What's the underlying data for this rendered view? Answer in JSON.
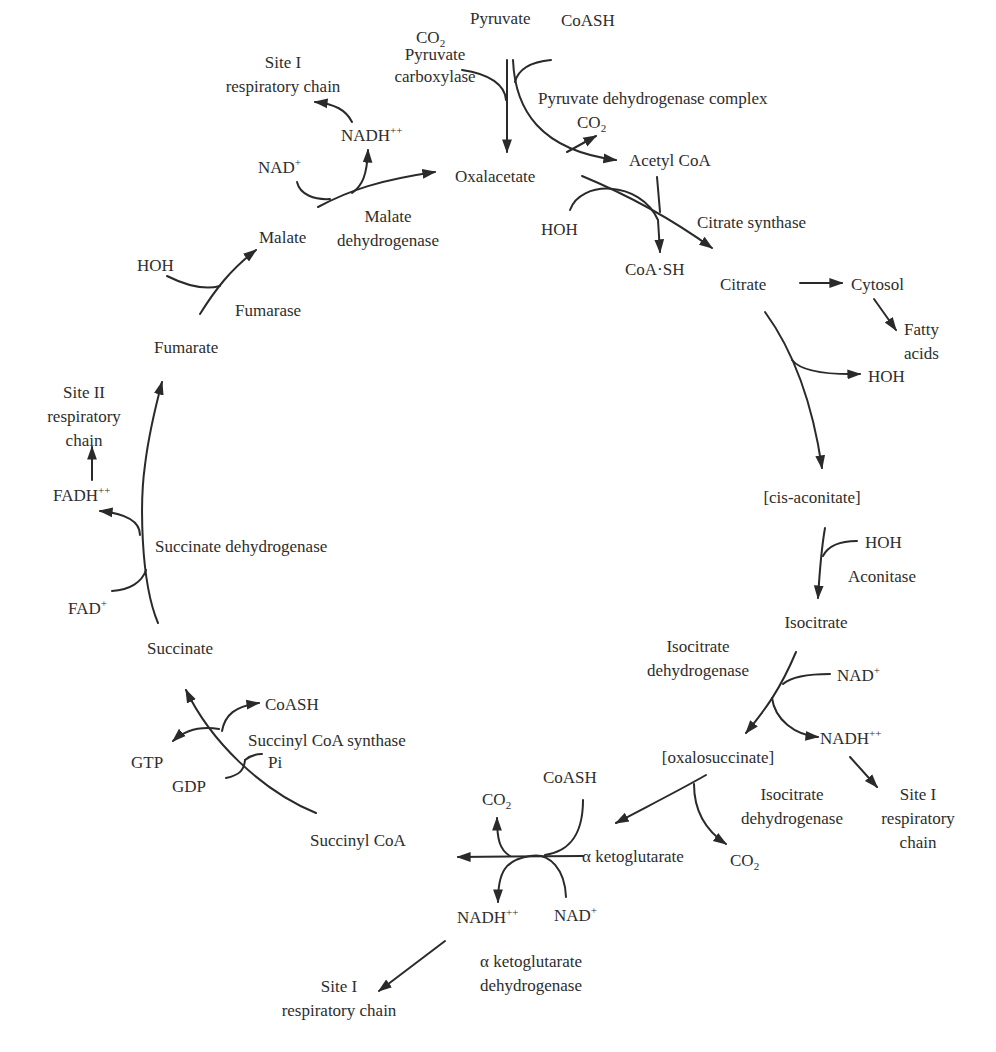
{
  "diagram": {
    "metabolites": {
      "pyruvate": "Pyruvate",
      "oxalacetate": "Oxalacetate",
      "acetyl_coa": "Acetyl CoA",
      "citrate": "Citrate",
      "cis_aconitate": "[cis-aconitate]",
      "isocitrate": "Isocitrate",
      "oxalosuccinate": "[oxalosuccinate]",
      "alpha_ketoglutarate": "α ketoglutarate",
      "succinyl_coa": "Succinyl CoA",
      "succinate": "Succinate",
      "fumarate": "Fumarate",
      "malate": "Malate",
      "cytosol": "Cytosol",
      "fatty_acids_1": "Fatty",
      "fatty_acids_2": "acids"
    },
    "enzymes": {
      "pyruvate_carboxylase_1": "Pyruvate",
      "pyruvate_carboxylase_2": "carboxylase",
      "pyruvate_dehydrogenase_complex": "Pyruvate dehydrogenase complex",
      "citrate_synthase": "Citrate synthase",
      "aconitase": "Aconitase",
      "isocitrate_dehydrogenase_top_1": "Isocitrate",
      "isocitrate_dehydrogenase_top_2": "dehydrogenase",
      "isocitrate_dehydrogenase_bottom_1": "Isocitrate",
      "isocitrate_dehydrogenase_bottom_2": "dehydrogenase",
      "akg_dehydrogenase_1": "α ketoglutarate",
      "akg_dehydrogenase_2": "dehydrogenase",
      "succinyl_coa_synthase": "Succinyl CoA synthase",
      "succinate_dehydrogenase": "Succinate dehydrogenase",
      "fumarase": "Fumarase",
      "malate_dehydrogenase_1": "Malate",
      "malate_dehydrogenase_2": "dehydrogenase"
    },
    "cofactors": {
      "co2_pc": "CO",
      "co2_pdh": "CO",
      "co2_akgdh": "CO",
      "co2_icdh": "CO",
      "co2_sub": "2",
      "coash_pdh": "CoASH",
      "coash_akgdh": "CoASH",
      "coash_scs": "CoASH",
      "coa_sh_cs": "CoA·SH",
      "hoh_cs": "HOH",
      "hoh_citrate": "HOH",
      "hoh_aconitase": "HOH",
      "hoh_fumarase": "HOH",
      "nad_icdh": "NAD",
      "nad_akgdh": "NAD",
      "nad_mdh": "NAD",
      "nad_sup": "+",
      "nadh_icdh": "NADH",
      "nadh_akgdh": "NADH",
      "nadh_mdh": "NADH",
      "nadh_sup": "++",
      "fad": "FAD",
      "fad_sup": "+",
      "fadh": "FADH",
      "fadh_sup": "++",
      "gtp": "GTP",
      "gdp": "GDP",
      "pi": "Pi"
    },
    "respiratory_sites": {
      "site1_mdh_1": "Site I",
      "site1_mdh_2": "respiratory chain",
      "site1_icdh_1": "Site I",
      "site1_icdh_2": "respiratory",
      "site1_icdh_3": "chain",
      "site1_akgdh_1": "Site I",
      "site1_akgdh_2": "respiratory chain",
      "site2_sdh_1": "Site II",
      "site2_sdh_2": "respiratory",
      "site2_sdh_3": "chain"
    },
    "colors": {
      "line": "#2a2a2a",
      "text": "#2d2d2d",
      "background": "#ffffff"
    }
  }
}
